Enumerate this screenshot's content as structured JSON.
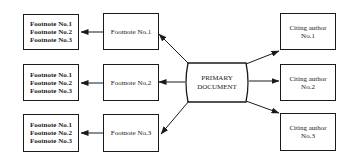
{
  "primary": {
    "line1": "PRIMARY",
    "line2": "DOCUMENT"
  },
  "footnotes": [
    {
      "label": "Footnote No.1",
      "list": [
        "Footnote No.1",
        "Footnote No.2",
        "Footnote No.3"
      ]
    },
    {
      "label": "Footnote No.2",
      "list": [
        "Footnote No.1",
        "Footnote No.2",
        "Footnote No.3"
      ]
    },
    {
      "label": "Footnote No.3",
      "list": [
        "Footnote No.1",
        "Footnote No.2",
        "Footnote No.3"
      ]
    }
  ],
  "citing": [
    {
      "line1": "Citing author",
      "line2": "No.1"
    },
    {
      "line1": "Citing author",
      "line2": "No.2"
    },
    {
      "line1": "Citing author",
      "line2": "No.3"
    }
  ]
}
